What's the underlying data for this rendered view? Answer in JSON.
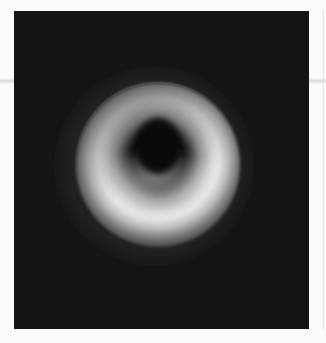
{
  "image": {
    "subject": "black-hole-ring",
    "description": "Grayscale image of a bright ring of light surrounding a dark central shadow on a black background",
    "colors": {
      "page_background": "#fbfbfb",
      "frame_background": "#141414",
      "ring_peak": "#e8e8e8",
      "shadow": "#0a0a0a"
    }
  }
}
